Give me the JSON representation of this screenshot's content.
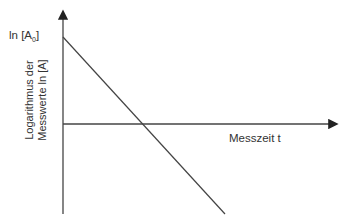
{
  "diagram": {
    "y_intercept_label": "ln [A",
    "y_intercept_sub": "0",
    "y_intercept_close": "]",
    "x_axis_label": "Messzeit t",
    "y_axis_label_line1": "Logarithmus der",
    "y_axis_label_line2": "Messwerte ln [A]",
    "colors": {
      "axis": "#333333",
      "line": "#333333",
      "text": "#333333"
    }
  }
}
